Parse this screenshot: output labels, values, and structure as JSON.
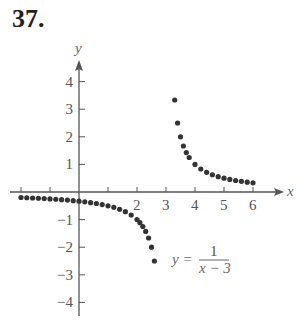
{
  "problem_number": "37.",
  "equation": {
    "lhs": "y =",
    "numerator": "1",
    "denominator": "x − 3"
  },
  "chart_data": {
    "type": "scatter",
    "title": "",
    "xlabel": "x",
    "ylabel": "y",
    "xlim": [
      -2,
      6.5
    ],
    "ylim": [
      -4.5,
      4.6
    ],
    "x_ticks": [
      -2,
      -1,
      0,
      1,
      2,
      3,
      4,
      5,
      6
    ],
    "x_tick_labels": [
      "2",
      "3",
      "4",
      "5",
      "6"
    ],
    "y_ticks": [
      -4,
      -3,
      -2,
      -1,
      1,
      2,
      3,
      4
    ],
    "y_tick_labels": [
      "−4",
      "−3",
      "−2",
      "−1",
      "1",
      "2",
      "3",
      "4"
    ],
    "grid": false,
    "annotation": "y = 1/(x − 3)",
    "series": [
      {
        "name": "y = 1/(x-3), x<3",
        "x": [
          -2.0,
          -1.8,
          -1.6,
          -1.4,
          -1.2,
          -1.0,
          -0.8,
          -0.6,
          -0.4,
          -0.2,
          0.0,
          0.2,
          0.4,
          0.6,
          0.8,
          1.0,
          1.2,
          1.4,
          1.6,
          1.8,
          2.0,
          2.1,
          2.2,
          2.3,
          2.4,
          2.5,
          2.6
        ],
        "y": [
          -0.2,
          -0.208,
          -0.217,
          -0.227,
          -0.238,
          -0.25,
          -0.263,
          -0.278,
          -0.294,
          -0.313,
          -0.333,
          -0.357,
          -0.385,
          -0.417,
          -0.455,
          -0.5,
          -0.556,
          -0.625,
          -0.714,
          -0.833,
          -1.0,
          -1.111,
          -1.25,
          -1.429,
          -1.667,
          -2.0,
          -2.5
        ]
      },
      {
        "name": "y = 1/(x-3), x>3",
        "x": [
          3.3,
          3.4,
          3.5,
          3.6,
          3.7,
          3.8,
          4.0,
          4.2,
          4.4,
          4.6,
          4.8,
          5.0,
          5.2,
          5.4,
          5.6,
          5.8,
          6.0
        ],
        "y": [
          3.333,
          2.5,
          2.0,
          1.667,
          1.429,
          1.25,
          1.0,
          0.833,
          0.714,
          0.625,
          0.556,
          0.5,
          0.455,
          0.417,
          0.385,
          0.357,
          0.333
        ]
      }
    ]
  }
}
